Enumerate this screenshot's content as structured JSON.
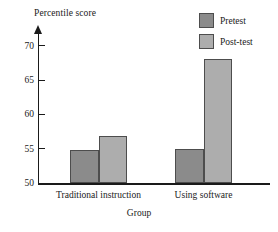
{
  "chart_data": {
    "type": "bar",
    "title": "",
    "xlabel": "Group",
    "ylabel": "Percentile score",
    "categories": [
      "Traditional instruction",
      "Using software"
    ],
    "series": [
      {
        "name": "Pretest",
        "color": "#8b8b8b",
        "values": [
          54.8,
          55.0
        ]
      },
      {
        "name": "Post-test",
        "color": "#adadad",
        "values": [
          56.8,
          68.0
        ]
      }
    ],
    "ylim": [
      50,
      72
    ],
    "yticks": [
      50,
      55,
      60,
      65,
      70
    ],
    "ytick_labels": [
      "50",
      "55",
      "60",
      "65",
      "70"
    ],
    "grid": false,
    "legend_position": "top-right"
  },
  "axes": {
    "y_title": "Percentile score",
    "x_title": "Group",
    "ticks": [
      {
        "label": "70",
        "value": 70
      },
      {
        "label": "65",
        "value": 65
      },
      {
        "label": "60",
        "value": 60
      },
      {
        "label": "55",
        "value": 55
      },
      {
        "label": "50",
        "value": 50
      }
    ]
  },
  "categories": [
    {
      "label": "Traditional instruction"
    },
    {
      "label": "Using software"
    }
  ],
  "legend": {
    "items": [
      {
        "label": "Pretest",
        "color": "#8b8b8b"
      },
      {
        "label": "Post-test",
        "color": "#adadad"
      }
    ]
  }
}
